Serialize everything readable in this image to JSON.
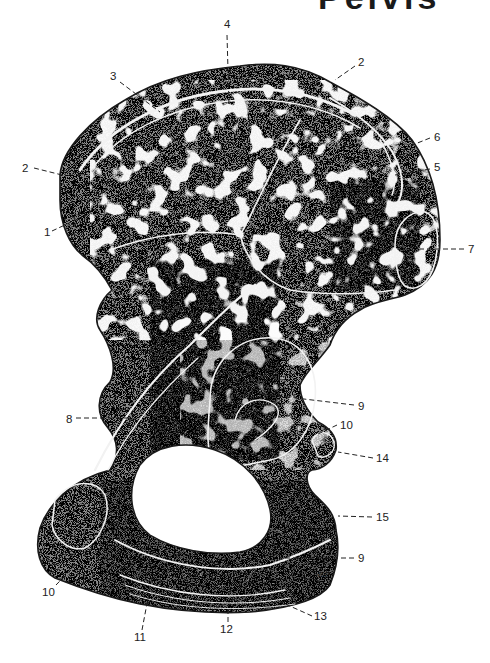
{
  "figure": {
    "cut_title_fragment": "Pelvis",
    "signature": "R.P",
    "colors": {
      "bone_dark": "#3a3a3a",
      "bone_mid": "#7a7a7a",
      "cortex_light": "#e6e6e6",
      "background": "#ffffff",
      "ink": "#222222"
    }
  },
  "labels": [
    {
      "id": "l4",
      "text": "4",
      "x": 224,
      "y": 28,
      "lx1": 227,
      "ly1": 35,
      "lx2": 229,
      "ly2": 105
    },
    {
      "id": "l3",
      "text": "3",
      "x": 110,
      "y": 80,
      "lx1": 120,
      "ly1": 82,
      "lx2": 160,
      "ly2": 112
    },
    {
      "id": "l2a",
      "text": "2",
      "x": 358,
      "y": 66,
      "lx1": 355,
      "ly1": 66,
      "lx2": 335,
      "ly2": 80
    },
    {
      "id": "l6",
      "text": "6",
      "x": 434,
      "y": 141,
      "lx1": 430,
      "ly1": 138,
      "lx2": 410,
      "ly2": 146
    },
    {
      "id": "l5",
      "text": "5",
      "x": 434,
      "y": 171,
      "lx1": 430,
      "ly1": 169,
      "lx2": 395,
      "ly2": 175
    },
    {
      "id": "l2b",
      "text": "2",
      "x": 22,
      "y": 172,
      "lx1": 34,
      "ly1": 168,
      "lx2": 66,
      "ly2": 176
    },
    {
      "id": "l7",
      "text": "7",
      "x": 468,
      "y": 253,
      "lx1": 464,
      "ly1": 249,
      "lx2": 420,
      "ly2": 249
    },
    {
      "id": "l1",
      "text": "1",
      "x": 44,
      "y": 236,
      "lx1": 52,
      "ly1": 231,
      "lx2": 82,
      "ly2": 217
    },
    {
      "id": "l9a",
      "text": "9",
      "x": 358,
      "y": 410,
      "lx1": 354,
      "ly1": 405,
      "lx2": 262,
      "ly2": 394
    },
    {
      "id": "l8",
      "text": "8",
      "x": 66,
      "y": 423,
      "lx1": 76,
      "ly1": 418,
      "lx2": 132,
      "ly2": 418
    },
    {
      "id": "l10a",
      "text": "10",
      "x": 340,
      "y": 429,
      "lx1": 337,
      "ly1": 425,
      "lx2": 316,
      "ly2": 435
    },
    {
      "id": "l14",
      "text": "14",
      "x": 376,
      "y": 462,
      "lx1": 373,
      "ly1": 458,
      "lx2": 338,
      "ly2": 452
    },
    {
      "id": "l15",
      "text": "15",
      "x": 376,
      "y": 521,
      "lx1": 372,
      "ly1": 517,
      "lx2": 338,
      "ly2": 516
    },
    {
      "id": "l9b",
      "text": "9",
      "x": 358,
      "y": 562,
      "lx1": 354,
      "ly1": 558,
      "lx2": 280,
      "ly2": 558
    },
    {
      "id": "l10b",
      "text": "10",
      "x": 42,
      "y": 596,
      "lx1": 56,
      "ly1": 585,
      "lx2": 90,
      "ly2": 550
    },
    {
      "id": "l11",
      "text": "11",
      "x": 134,
      "y": 641,
      "lx1": 142,
      "ly1": 630,
      "lx2": 152,
      "ly2": 577
    },
    {
      "id": "l12",
      "text": "12",
      "x": 220,
      "y": 633,
      "lx1": 228,
      "ly1": 622,
      "lx2": 228,
      "ly2": 605
    },
    {
      "id": "l13",
      "text": "13",
      "x": 314,
      "y": 620,
      "lx1": 312,
      "ly1": 616,
      "lx2": 252,
      "ly2": 589
    }
  ]
}
